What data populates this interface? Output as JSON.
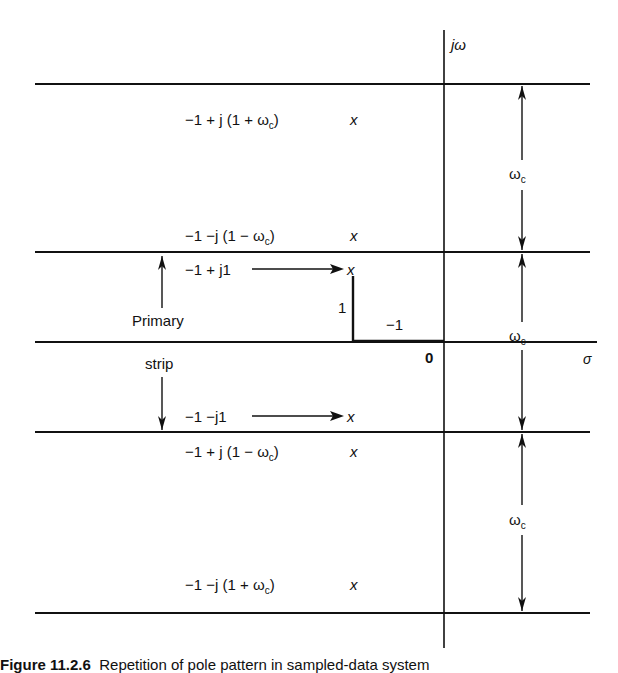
{
  "axes": {
    "vertical_label": "jω",
    "horizontal_label": "σ",
    "origin_label": "0"
  },
  "poles": [
    {
      "label": "−1 + j (1 + ω",
      "sub": "c",
      "close": ")",
      "marker": "x"
    },
    {
      "label": "−1 −j (1 − ω",
      "sub": "c",
      "close": ")",
      "marker": "x"
    },
    {
      "label": "−1 + j1",
      "marker": "x"
    },
    {
      "label": "−1 −j1",
      "marker": "x"
    },
    {
      "label": "−1 + j (1 − ω",
      "sub": "c",
      "close": ")",
      "marker": "x"
    },
    {
      "label": "−1 −j (1 + ω",
      "sub": "c",
      "close": ")",
      "marker": "x"
    }
  ],
  "annotations": {
    "primary": "Primary",
    "strip": "strip",
    "one": "1",
    "minus_one": "−1",
    "omega": "ω",
    "omega_sub": "c"
  },
  "caption": {
    "number": "Figure 11.2.6",
    "text": "Repetition of pole pattern in sampled-data system"
  }
}
